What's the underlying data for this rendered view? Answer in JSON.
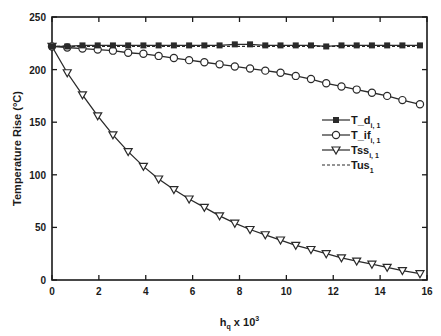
{
  "chart_data": {
    "type": "line",
    "title": "",
    "xlabel": "h_q x 10^3",
    "xlabel_main": "h",
    "xlabel_sub": "q",
    "xlabel_tail": " x 10",
    "xlabel_sup": "3",
    "ylabel": "Temperature Rise (°C)",
    "xlim": [
      0,
      16
    ],
    "ylim": [
      0,
      250
    ],
    "xticks": [
      0,
      2,
      4,
      6,
      8,
      10,
      12,
      14,
      16
    ],
    "yticks": [
      0,
      50,
      100,
      150,
      200,
      250
    ],
    "grid": false,
    "legend_position": "right-middle inside",
    "x": [
      0,
      0.65,
      1.3,
      1.95,
      2.6,
      3.25,
      3.9,
      4.55,
      5.2,
      5.85,
      6.5,
      7.15,
      7.8,
      8.45,
      9.1,
      9.75,
      10.4,
      11.05,
      11.7,
      12.35,
      13.0,
      13.65,
      14.3,
      14.95,
      15.7
    ],
    "series": [
      {
        "name": "T_d_i,1",
        "label": "T_d",
        "sub": "i, 1",
        "marker": "square-filled",
        "line": "solid",
        "values": [
          222,
          222,
          223,
          223,
          223,
          223,
          223,
          223,
          223,
          223,
          223,
          223,
          224,
          224,
          223,
          223,
          223,
          223,
          222,
          223,
          223,
          223,
          223,
          223,
          223
        ]
      },
      {
        "name": "T_if_i,1",
        "label": "T_if",
        "sub": "i, 1",
        "marker": "circle-open",
        "line": "solid",
        "values": [
          222,
          221,
          220,
          219,
          218,
          216,
          215,
          213,
          211,
          209,
          207,
          205,
          203,
          201,
          199,
          197,
          194,
          191,
          187,
          184,
          181,
          178,
          175,
          171,
          167
        ]
      },
      {
        "name": "Tss_i,1",
        "label": "Tss",
        "sub": "i, 1",
        "marker": "triangle-down-open",
        "line": "solid",
        "values": [
          222,
          197,
          176,
          156,
          138,
          122,
          108,
          96,
          86,
          77,
          69,
          61,
          54,
          48,
          43,
          38,
          33,
          29,
          25,
          21,
          18,
          15,
          12,
          9,
          6
        ]
      },
      {
        "name": "Tus_1",
        "label": "Tus",
        "sub": "1",
        "marker": "none",
        "line": "dashed",
        "values": [
          222,
          222,
          222,
          222,
          222,
          222,
          222,
          222,
          222,
          222,
          222,
          222,
          222,
          222,
          222,
          222,
          222,
          222,
          222,
          222,
          222,
          222,
          222,
          222,
          222
        ]
      }
    ]
  },
  "colors": {
    "line": "#2a2a2a",
    "axis": "#1a1a1a",
    "background": "#ffffff"
  }
}
